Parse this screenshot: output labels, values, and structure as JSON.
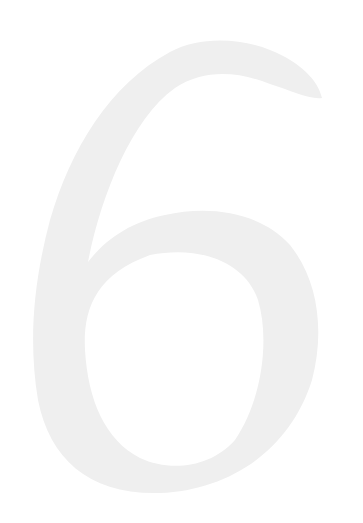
{
  "glyph": {
    "character": "6",
    "fill_color": "#efefef",
    "background_color": "#ffffff"
  }
}
